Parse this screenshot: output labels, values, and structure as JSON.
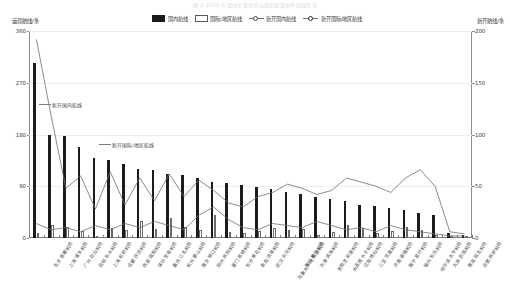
{
  "title": "图 2 2019 年我国主要机场运营航线及新开航线情况",
  "axes": {
    "y_left_title": "运营航线/条",
    "y_right_title": "新开航线/条",
    "y_left_ticks": [
      "0",
      "90",
      "180",
      "270",
      "360"
    ],
    "y_right_ticks": [
      "0",
      "50",
      "100",
      "150",
      "200"
    ]
  },
  "legend": [
    {
      "label": "国内航线",
      "marker": "filled-square"
    },
    {
      "label": "国际/地区航线",
      "marker": "hollow-square"
    },
    {
      "label": "新开国内航线",
      "marker": "line-circle"
    },
    {
      "label": "新开国际/地区航线",
      "marker": "line-circle"
    }
  ],
  "annotations": [
    {
      "text": "新开国内航线",
      "x": 52,
      "y": 101
    },
    {
      "text": "新开国际/地区航线",
      "x": 112,
      "y": 141
    }
  ],
  "chart_data": {
    "type": "bar",
    "title": "2019 年我国主要机场运营航线及新开航线情况",
    "xlabel": "",
    "ylabel": "运营航线/条",
    "ylabel_right": "新开航线/条",
    "ylim": [
      0,
      360
    ],
    "ylim_right": [
      0,
      200
    ],
    "grid": true,
    "legend_position": "top-center",
    "categories": [
      "北京首都机场",
      "上海浦东机场",
      "广州白云机场",
      "昆明长水机场",
      "上海虹桥机场",
      "成都双流机场",
      "西安咸阳机场",
      "深圳宝安机场",
      "重庆江北机场",
      "杭州萧山机场",
      "南京禄口机场",
      "郑州新郑机场",
      "厦门高崎机场",
      "长沙黄花机场",
      "青岛流亭机场",
      "武汉天河机场",
      "乌鲁木齐地窝堡机场",
      "海口美兰机场",
      "天津滨海机场",
      "贵阳龙洞堡机场",
      "大连周水子机场",
      "沈阳桃仙机场",
      "三亚凤凰机场",
      "济南遥墙机场",
      "南宁吴圩机场",
      "福州长乐机场",
      "哈尔滨太平机场",
      "太原武宿机场",
      "南昌昌北机场",
      "合肥新桥机场"
    ],
    "series": [
      {
        "name": "国内航线",
        "axis": "left",
        "type": "bar",
        "values": [
          305,
          180,
          178,
          158,
          140,
          135,
          128,
          120,
          118,
          112,
          110,
          105,
          98,
          96,
          92,
          88,
          85,
          80,
          76,
          72,
          68,
          64,
          58,
          55,
          52,
          48,
          44,
          40,
          8,
          6
        ]
      },
      {
        "name": "国际/地区航线",
        "axis": "left",
        "type": "bar",
        "values": [
          8,
          22,
          20,
          12,
          4,
          18,
          14,
          30,
          16,
          34,
          20,
          14,
          40,
          10,
          8,
          12,
          18,
          14,
          16,
          6,
          10,
          22,
          18,
          8,
          12,
          20,
          14,
          6,
          2,
          2
        ]
      },
      {
        "name": "新开国内航线",
        "axis": "right",
        "type": "line",
        "values": [
          192,
          118,
          48,
          60,
          28,
          64,
          32,
          58,
          36,
          62,
          40,
          56,
          46,
          34,
          30,
          40,
          44,
          52,
          48,
          42,
          46,
          58,
          54,
          50,
          44,
          58,
          66,
          50,
          6,
          4
        ]
      },
      {
        "name": "新开国际/地区航线",
        "axis": "right",
        "type": "line",
        "values": [
          14,
          8,
          10,
          6,
          12,
          8,
          14,
          10,
          16,
          12,
          8,
          22,
          30,
          18,
          10,
          8,
          14,
          12,
          10,
          16,
          12,
          8,
          10,
          6,
          12,
          8,
          6,
          4,
          2,
          2
        ]
      }
    ]
  }
}
